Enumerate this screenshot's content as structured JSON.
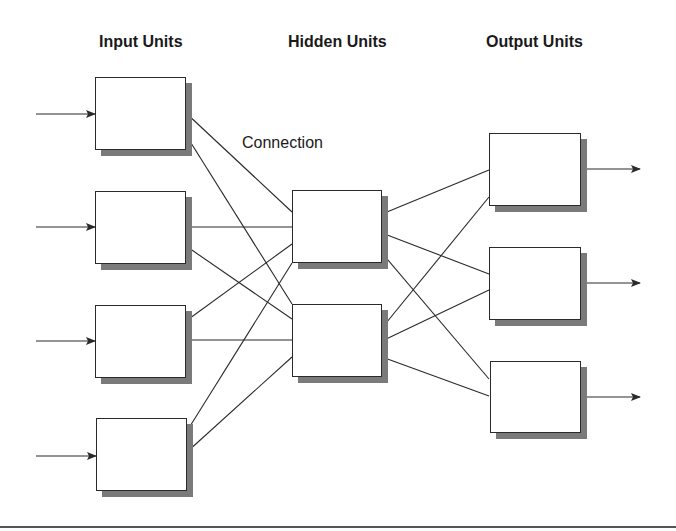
{
  "diagram": {
    "type": "feedforward-neural-network",
    "layers": [
      {
        "id": "input",
        "title": "Input Units",
        "unit_count": 4
      },
      {
        "id": "hidden",
        "title": "Hidden Units",
        "unit_count": 2
      },
      {
        "id": "output",
        "title": "Output Units",
        "unit_count": 3
      }
    ],
    "connection_label": "Connection",
    "units": {
      "input": [
        {
          "x": 95,
          "y": 77,
          "w": 91,
          "h": 73
        },
        {
          "x": 95,
          "y": 191,
          "w": 91,
          "h": 73
        },
        {
          "x": 95,
          "y": 305,
          "w": 91,
          "h": 73
        },
        {
          "x": 96,
          "y": 418,
          "w": 91,
          "h": 73
        }
      ],
      "hidden": [
        {
          "x": 292,
          "y": 190,
          "w": 90,
          "h": 73
        },
        {
          "x": 292,
          "y": 304,
          "w": 90,
          "h": 73
        }
      ],
      "output": [
        {
          "x": 489,
          "y": 133,
          "w": 92,
          "h": 73
        },
        {
          "x": 489,
          "y": 247,
          "w": 92,
          "h": 73
        },
        {
          "x": 490,
          "y": 361,
          "w": 91,
          "h": 72
        }
      ]
    },
    "input_arrows": [
      {
        "x1": 36,
        "y1": 114,
        "x2": 95,
        "y2": 114
      },
      {
        "x1": 36,
        "y1": 227,
        "x2": 95,
        "y2": 227
      },
      {
        "x1": 36,
        "y1": 341,
        "x2": 95,
        "y2": 341
      },
      {
        "x1": 36,
        "y1": 456,
        "x2": 96,
        "y2": 456
      }
    ],
    "output_arrows": [
      {
        "x1": 581,
        "y1": 169,
        "x2": 640,
        "y2": 169
      },
      {
        "x1": 581,
        "y1": 283,
        "x2": 640,
        "y2": 283
      },
      {
        "x1": 581,
        "y1": 397,
        "x2": 640,
        "y2": 397
      }
    ],
    "connections": [
      {
        "from": "input-1",
        "to": "hidden-1",
        "x1": 186,
        "y1": 113,
        "x2": 292,
        "y2": 212
      },
      {
        "from": "input-1",
        "to": "hidden-2",
        "x1": 186,
        "y1": 135,
        "x2": 292,
        "y2": 304
      },
      {
        "from": "input-2",
        "to": "hidden-1",
        "x1": 186,
        "y1": 227,
        "x2": 292,
        "y2": 227
      },
      {
        "from": "input-2",
        "to": "hidden-2",
        "x1": 186,
        "y1": 246,
        "x2": 292,
        "y2": 319
      },
      {
        "from": "input-3",
        "to": "hidden-1",
        "x1": 186,
        "y1": 321,
        "x2": 292,
        "y2": 244
      },
      {
        "from": "input-3",
        "to": "hidden-2",
        "x1": 186,
        "y1": 340,
        "x2": 292,
        "y2": 340
      },
      {
        "from": "input-4",
        "to": "hidden-1",
        "x1": 187,
        "y1": 431,
        "x2": 292,
        "y2": 263
      },
      {
        "from": "input-4",
        "to": "hidden-2",
        "x1": 187,
        "y1": 452,
        "x2": 292,
        "y2": 357
      },
      {
        "from": "hidden-1",
        "to": "output-1",
        "x1": 382,
        "y1": 214,
        "x2": 489,
        "y2": 170
      },
      {
        "from": "hidden-1",
        "to": "output-2",
        "x1": 382,
        "y1": 233,
        "x2": 489,
        "y2": 274
      },
      {
        "from": "hidden-1",
        "to": "output-3",
        "x1": 382,
        "y1": 253,
        "x2": 489,
        "y2": 379
      },
      {
        "from": "hidden-2",
        "to": "output-1",
        "x1": 382,
        "y1": 328,
        "x2": 489,
        "y2": 197
      },
      {
        "from": "hidden-2",
        "to": "output-2",
        "x1": 382,
        "y1": 341,
        "x2": 489,
        "y2": 290
      },
      {
        "from": "hidden-2",
        "to": "output-3",
        "x1": 382,
        "y1": 357,
        "x2": 489,
        "y2": 396
      }
    ],
    "colors": {
      "line": "#2a2a2a",
      "box_border": "#2a2a2a",
      "box_fill": "#ffffff",
      "shadow": "#7a7a7a",
      "text": "#1a1a1a",
      "background": "#ffffff"
    }
  }
}
